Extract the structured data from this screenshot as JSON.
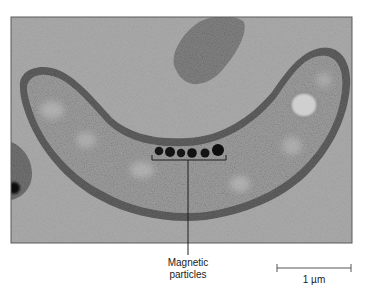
{
  "figure": {
    "type": "transmission electron micrograph",
    "background_color": "#a6a6a6",
    "cell_color": "#8c8c8c",
    "particle_color": "#141414",
    "particle_count": 6
  },
  "annotations": {
    "magnetic_particles": {
      "line1": "Magnetic",
      "line2": "particles"
    },
    "scale_bar": {
      "label": "1 µm"
    }
  }
}
